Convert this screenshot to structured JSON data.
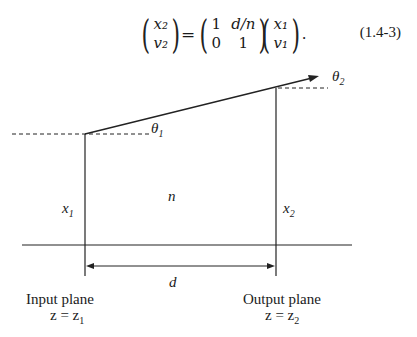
{
  "equation": {
    "lhs": {
      "top": "x₂",
      "bottom": "v₂"
    },
    "equals": "=",
    "matrix": {
      "r1c1": "1",
      "r1c2": "d/n",
      "r2c1": "0",
      "r2c2": "1"
    },
    "rhs": {
      "top": "x₁",
      "bottom": "v₁"
    },
    "trailing": ".",
    "number": "(1.4-3)"
  },
  "diagram": {
    "theta1": "θ",
    "theta1_sub": "1",
    "theta2": "θ",
    "theta2_sub": "2",
    "x1": "x",
    "x1_sub": "1",
    "x2": "x",
    "x2_sub": "2",
    "medium": "n",
    "distance": "d",
    "input_plane": "Input plane",
    "input_eq": "z = z",
    "input_eq_sub": "1",
    "output_plane": "Output plane",
    "output_eq": "z = z",
    "output_eq_sub": "2",
    "line_color": "#222222"
  }
}
